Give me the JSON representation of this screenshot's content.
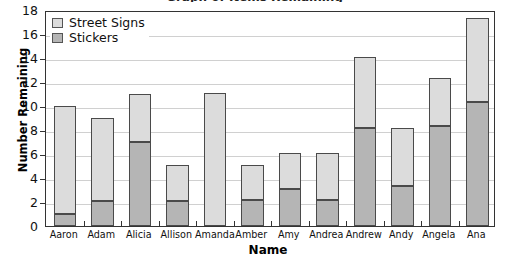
{
  "chart_data": {
    "type": "bar",
    "subtype": "stacked-vertical",
    "title": "Graph of Items Remaining",
    "xlabel": "Name",
    "ylabel": "Number Remaining",
    "ylim": [
      0,
      18
    ],
    "ytick_step": 2,
    "yticks": [
      0,
      2,
      4,
      6,
      8,
      10,
      12,
      14,
      16,
      18
    ],
    "grid": "horizontal",
    "legend_position": "top-left-inside",
    "categories": [
      "Aaron",
      "Adam",
      "Alicia",
      "Allison",
      "Amanda",
      "Amber",
      "Amy",
      "Andrea",
      "Andrew",
      "Andy",
      "Angela",
      "Ana"
    ],
    "series": [
      {
        "name": "Stickers",
        "color": "#b5b5b5",
        "values": [
          1.0,
          2.1,
          7.0,
          2.1,
          0.0,
          2.2,
          3.1,
          2.2,
          8.2,
          3.3,
          8.3,
          10.3
        ]
      },
      {
        "name": "Street Signs",
        "color": "#dcdcdc",
        "values": [
          9.0,
          6.9,
          4.0,
          3.0,
          11.1,
          2.9,
          3.0,
          3.9,
          5.9,
          4.9,
          4.0,
          7.0
        ]
      }
    ],
    "totals": [
      10.0,
      9.0,
      11.0,
      5.1,
      11.1,
      5.1,
      6.1,
      6.1,
      14.1,
      8.2,
      12.3,
      17.3
    ],
    "colors": {
      "series_street_signs": "#dcdcdc",
      "series_stickers": "#b5b5b5",
      "bar_outline": "#4a4a4a",
      "gridline": "#d0d0d0",
      "axis": "#333333",
      "text": "#111111",
      "background": "#ffffff"
    }
  }
}
